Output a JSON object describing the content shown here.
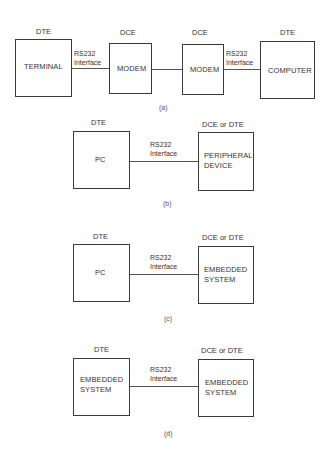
{
  "panel_a": {
    "caption": "(a)",
    "terminal": {
      "role": "DTE",
      "name": "TERMINAL"
    },
    "modem1": {
      "role": "DCE",
      "name": "MODEM"
    },
    "modem2": {
      "role": "DCE",
      "name": "MODEM"
    },
    "computer": {
      "role": "DTE",
      "name": "COMPUTER"
    },
    "link_left": {
      "line1": "RS232",
      "line2": "Interface"
    },
    "link_right": {
      "line1": "RS232",
      "line2": "Interface"
    }
  },
  "panel_b": {
    "caption": "(b)",
    "left": {
      "role": "DTE",
      "name_line1": "PC"
    },
    "right": {
      "role": "DCE or DTE",
      "name_line1": "PERIPHERAL",
      "name_line2": "DEVICE"
    },
    "link": {
      "line1": "RS232",
      "line2": "Interface"
    }
  },
  "panel_c": {
    "caption": "(c)",
    "left": {
      "role": "DTE",
      "name_line1": "PC"
    },
    "right": {
      "role": "DCE or DTE",
      "name_line1": "EMBEDDED",
      "name_line2": "SYSTEM"
    },
    "link": {
      "line1": "RS232",
      "line2": "Interface"
    }
  },
  "panel_d": {
    "caption": "(d)",
    "left": {
      "role": "DTE",
      "name_line1": "EMBEDDED",
      "name_line2": "SYSTEM"
    },
    "right": {
      "role": "DCE or DTE",
      "name_line1": "EMBEDDED",
      "name_line2": "SYSTEM"
    },
    "link": {
      "line1": "RS232",
      "line2": "Interface"
    }
  }
}
